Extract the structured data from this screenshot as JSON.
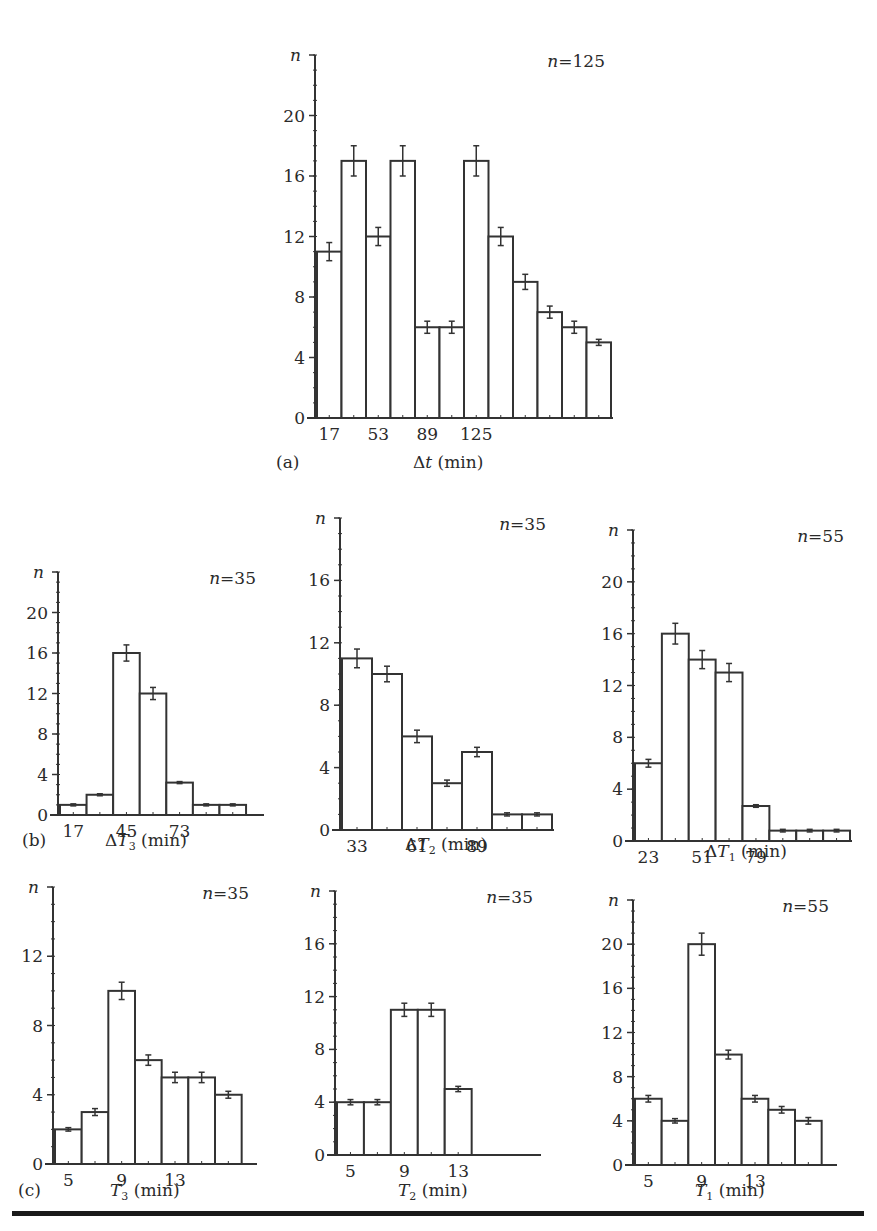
{
  "figure": {
    "panel_labels": {
      "a": "(a)",
      "b": "(b)",
      "c": "(c)"
    }
  },
  "chart_data": [
    {
      "id": "a",
      "type": "bar",
      "title": "n=125",
      "xlabel": "Δt (min)",
      "ylabel": "n",
      "yticks": [
        0,
        4,
        8,
        12,
        16,
        20
      ],
      "ylim": [
        0,
        24
      ],
      "xticks": [
        {
          "bin": 0,
          "label": "17"
        },
        {
          "bin": 2,
          "label": "53"
        },
        {
          "bin": 4,
          "label": "89"
        },
        {
          "bin": 6,
          "label": "125"
        }
      ],
      "values": [
        11,
        17,
        12,
        17,
        6,
        6,
        17,
        12,
        9,
        7,
        6,
        5
      ],
      "errors": [
        0.6,
        1,
        0.6,
        1,
        0.4,
        0.4,
        1,
        0.6,
        0.5,
        0.4,
        0.4,
        0.2
      ],
      "bins_total": 12
    },
    {
      "id": "b1",
      "type": "bar",
      "title": "n=35",
      "xlabel": "ΔT3 (min)",
      "ylabel": "n",
      "yticks": [
        0,
        4,
        8,
        12,
        16,
        20
      ],
      "ylim": [
        0,
        24
      ],
      "xticks": [
        {
          "bin": 0,
          "label": "17"
        },
        {
          "bin": 2,
          "label": "45"
        },
        {
          "bin": 4,
          "label": "73"
        }
      ],
      "values": [
        1,
        2,
        16,
        12,
        3.2,
        1,
        1
      ],
      "errors": [
        0.1,
        0.1,
        0.8,
        0.6,
        0.1,
        0.1,
        0.1
      ],
      "bins_total": 7.6
    },
    {
      "id": "b2",
      "type": "bar",
      "title": "n=35",
      "xlabel": "ΔT2 (min)",
      "ylabel": "n",
      "yticks": [
        0,
        4,
        8,
        12,
        16
      ],
      "ylim": [
        0,
        20
      ],
      "xticks": [
        {
          "bin": 0,
          "label": "33"
        },
        {
          "bin": 2,
          "label": "61"
        },
        {
          "bin": 4,
          "label": "89"
        }
      ],
      "values": [
        11,
        10,
        6,
        3,
        5,
        1,
        1
      ],
      "errors": [
        0.6,
        0.5,
        0.4,
        0.2,
        0.3,
        0.1,
        0.1
      ],
      "bins_total": 7
    },
    {
      "id": "b3",
      "type": "bar",
      "title": "n=55",
      "xlabel": "ΔT1 (min)",
      "ylabel": "n",
      "yticks": [
        0,
        4,
        8,
        12,
        16,
        20
      ],
      "ylim": [
        0,
        24
      ],
      "xticks": [
        {
          "bin": 0,
          "label": "23"
        },
        {
          "bin": 2,
          "label": "51"
        },
        {
          "bin": 4,
          "label": "79"
        }
      ],
      "values": [
        6,
        16,
        14,
        13,
        2.7,
        0.8,
        0.8,
        0.8
      ],
      "errors": [
        0.3,
        0.8,
        0.7,
        0.7,
        0.1,
        0.1,
        0.1,
        0.1
      ],
      "bins_total": 8
    },
    {
      "id": "c1",
      "type": "bar",
      "title": "n=35",
      "xlabel": "T3 (min)",
      "ylabel": "n",
      "yticks": [
        0,
        4,
        8,
        12
      ],
      "ylim": [
        0,
        16
      ],
      "xticks": [
        {
          "bin": 0,
          "label": "5"
        },
        {
          "bin": 2,
          "label": "9"
        },
        {
          "bin": 4,
          "label": "13"
        }
      ],
      "values": [
        2,
        3,
        10,
        6,
        5,
        5,
        4
      ],
      "errors": [
        0.1,
        0.2,
        0.5,
        0.3,
        0.3,
        0.3,
        0.2
      ],
      "bins_total": 7.5
    },
    {
      "id": "c2",
      "type": "bar",
      "title": "n=35",
      "xlabel": "T2 (min)",
      "ylabel": "n",
      "yticks": [
        0,
        4,
        8,
        12,
        16
      ],
      "ylim": [
        0,
        20
      ],
      "xticks": [
        {
          "bin": 0,
          "label": "5"
        },
        {
          "bin": 2,
          "label": "9"
        },
        {
          "bin": 4,
          "label": "13"
        }
      ],
      "values": [
        4,
        4,
        11,
        11,
        5
      ],
      "errors": [
        0.2,
        0.2,
        0.5,
        0.5,
        0.2
      ],
      "bins_total": 7.5
    },
    {
      "id": "c3",
      "type": "bar",
      "title": "n=55",
      "xlabel": "T1 (min)",
      "ylabel": "n",
      "yticks": [
        0,
        4,
        8,
        12,
        16,
        20
      ],
      "ylim": [
        0,
        24
      ],
      "xticks": [
        {
          "bin": 0,
          "label": "5"
        },
        {
          "bin": 2,
          "label": "9"
        },
        {
          "bin": 4,
          "label": "13"
        }
      ],
      "values": [
        6,
        4,
        20,
        10,
        6,
        5,
        4
      ],
      "errors": [
        0.3,
        0.2,
        1,
        0.4,
        0.3,
        0.3,
        0.3
      ],
      "bins_total": 7.5
    }
  ]
}
